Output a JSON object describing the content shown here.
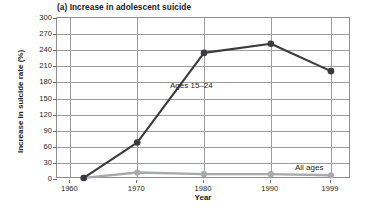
{
  "chart_data": {
    "type": "line",
    "title": "(a) Increase in adolescent suicide",
    "xlabel": "Year",
    "ylabel": "Increase in suicide rate (%)",
    "x": [
      1962,
      1970,
      1980,
      1990,
      1999
    ],
    "xtick_labels": [
      "1960",
      "1970",
      "1980",
      "1990",
      "1999"
    ],
    "xtick_values": [
      1960,
      1970,
      1980,
      1990,
      1999
    ],
    "ytick_labels": [
      "0",
      "30",
      "60",
      "90",
      "120",
      "150",
      "180",
      "210",
      "240",
      "270",
      "300"
    ],
    "ytick_values": [
      0,
      30,
      60,
      90,
      120,
      150,
      180,
      210,
      240,
      270,
      300
    ],
    "xlim": [
      1958,
      2002
    ],
    "ylim": [
      0,
      300
    ],
    "grid": "horizontal-and-vertical",
    "legend_position": "inline-annotations",
    "series": [
      {
        "name": "Ages 15–24",
        "color": "#3b3b3d",
        "marker": "circle",
        "values": [
          2,
          68,
          235,
          252,
          201
        ]
      },
      {
        "name": "All ages",
        "color": "#a7a9ac",
        "marker": "circle",
        "values": [
          2,
          12,
          9,
          9,
          7
        ]
      }
    ],
    "annotations": [
      {
        "text": "Ages 15–24",
        "series": "Ages 15–24"
      },
      {
        "text": "All ages",
        "series": "All ages"
      }
    ]
  },
  "colors": {
    "series_adolescent": "#3b3b3d",
    "series_all_ages": "#a7a9ac",
    "grid": "#9a9c9f",
    "axis": "#8d8f92",
    "text": "#231f20"
  }
}
